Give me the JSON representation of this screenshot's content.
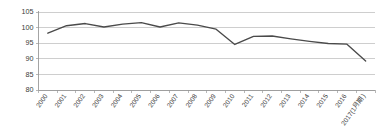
{
  "chart_data": {
    "type": "line",
    "title": "",
    "subtitle": "",
    "xlabel": "",
    "ylabel": "",
    "ylim": [
      80,
      105
    ],
    "xlim_categories_count": 18,
    "grid": true,
    "legend": false,
    "legend_position": "none",
    "line_color": "#4a4a4a",
    "grid_color": "#b9b9b9",
    "axis_color": "#9a9a9a",
    "background_color": "#ffffff",
    "y_ticks": [
      80,
      85,
      90,
      95,
      100,
      105
    ],
    "y_tick_labels": [
      "80",
      "85",
      "90",
      "95",
      "100",
      "105"
    ],
    "categories": [
      "2000",
      "2001",
      "2002",
      "2003",
      "2004",
      "2005",
      "2006",
      "2007",
      "2008",
      "2009",
      "2010",
      "2011",
      "2012",
      "2013",
      "2014",
      "2015",
      "2016",
      "2017(1月期)"
    ],
    "series": [
      {
        "name": "",
        "values": [
          98.2,
          100.6,
          101.3,
          100.2,
          101.1,
          101.6,
          100.2,
          101.5,
          100.8,
          99.5,
          94.6,
          97.2,
          97.3,
          96.4,
          95.6,
          94.9,
          94.7,
          89.3
        ]
      }
    ]
  }
}
